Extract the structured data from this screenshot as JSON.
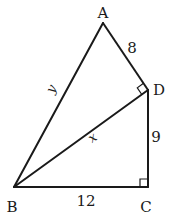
{
  "diagram": {
    "type": "geometry",
    "vertices": {
      "A": {
        "label": "A"
      },
      "B": {
        "label": "B"
      },
      "C": {
        "label": "C"
      },
      "D": {
        "label": "D"
      }
    },
    "segments": [
      {
        "id": "AB",
        "label": "y"
      },
      {
        "id": "AD",
        "label": "8"
      },
      {
        "id": "DC",
        "label": "9"
      },
      {
        "id": "BC",
        "label": "12"
      },
      {
        "id": "BD",
        "label": "x"
      }
    ],
    "right_angles": [
      "D (angle ADB)",
      "C (angle BCD)"
    ],
    "stroke_color": "#1a1a1a",
    "background": "#ffffff"
  }
}
